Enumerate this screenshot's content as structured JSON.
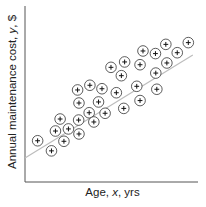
{
  "chart_data": {
    "type": "scatter",
    "title": "",
    "xlabel": "Age, x, yrs",
    "ylabel": "Annual maintenance cost, y, $",
    "xlabel_parts": {
      "pre": "Age, ",
      "var": "x",
      "post": ", yrs"
    },
    "ylabel_parts": {
      "pre": "Annual maintenance cost, ",
      "var": "y",
      "post": ", $"
    },
    "ticks": false,
    "grid": false,
    "legend": null,
    "marker": "circled-plus",
    "units": "relative (0-100 of plot area; no numeric ticks shown)",
    "xlim": [
      0,
      100
    ],
    "ylim": [
      0,
      100
    ],
    "points": [
      {
        "x": 7.3,
        "y": 23.7
      },
      {
        "x": 15.3,
        "y": 17.9
      },
      {
        "x": 20.3,
        "y": 36.2
      },
      {
        "x": 17.6,
        "y": 29.3
      },
      {
        "x": 25.1,
        "y": 30.5
      },
      {
        "x": 22.5,
        "y": 23.4
      },
      {
        "x": 30.4,
        "y": 52.9
      },
      {
        "x": 31.2,
        "y": 45.4
      },
      {
        "x": 31.0,
        "y": 35.6
      },
      {
        "x": 31.2,
        "y": 27.6
      },
      {
        "x": 37.5,
        "y": 55.6
      },
      {
        "x": 37.1,
        "y": 39.8
      },
      {
        "x": 39.8,
        "y": 34.5
      },
      {
        "x": 44.5,
        "y": 53.6
      },
      {
        "x": 42.5,
        "y": 46.0
      },
      {
        "x": 46.3,
        "y": 39.5
      },
      {
        "x": 49.7,
        "y": 65.9
      },
      {
        "x": 52.8,
        "y": 51.3
      },
      {
        "x": 55.7,
        "y": 61.1
      },
      {
        "x": 57.6,
        "y": 69.0
      },
      {
        "x": 57.1,
        "y": 42.3
      },
      {
        "x": 64.6,
        "y": 55.0
      },
      {
        "x": 66.5,
        "y": 67.4
      },
      {
        "x": 68.2,
        "y": 75.3
      },
      {
        "x": 66.5,
        "y": 46.8
      },
      {
        "x": 75.4,
        "y": 73.8
      },
      {
        "x": 75.6,
        "y": 62.6
      },
      {
        "x": 76.2,
        "y": 53.3
      },
      {
        "x": 81.4,
        "y": 79.1
      },
      {
        "x": 82.0,
        "y": 68.4
      },
      {
        "x": 88.0,
        "y": 74.3
      },
      {
        "x": 94.4,
        "y": 80.1
      }
    ],
    "regression_line": {
      "x0": 0,
      "y0": 13.8,
      "x1": 97,
      "y1": 73.0,
      "color": "#bdbdbd"
    }
  },
  "style": {
    "axis_color": "#555555",
    "marker_color": "#333333",
    "line_color": "#bdbdbd"
  },
  "plot_area": {
    "left": 25,
    "top": 8,
    "right": 198,
    "bottom": 182
  }
}
